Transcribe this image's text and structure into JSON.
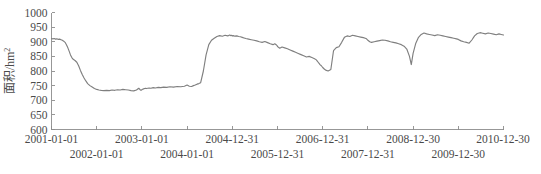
{
  "chart_data": {
    "type": "line",
    "title": "",
    "xlabel": "",
    "ylabel": "面积/hm",
    "ylabel_exponent": "2",
    "ylim": [
      600,
      1000
    ],
    "yticks": [
      600,
      650,
      700,
      750,
      800,
      850,
      900,
      950,
      1000
    ],
    "grid": false,
    "legend": null,
    "line_color": "#7f7f7f",
    "axis_color": "#8c8c8c",
    "xtick_labels_row1": [
      "2001-01-01",
      "2003-01-01",
      "2004-12-31",
      "2006-12-31",
      "2008-12-30",
      "2010-12-30"
    ],
    "xtick_labels_row2": [
      "2002-01-01",
      "2004-01-01",
      "2005-12-31",
      "2007-12-31",
      "2009-12-30"
    ],
    "xticks": [
      {
        "label": "2001-01-01",
        "row": 1,
        "t": 0
      },
      {
        "label": "2002-01-01",
        "row": 2,
        "t": 1
      },
      {
        "label": "2003-01-01",
        "row": 1,
        "t": 2
      },
      {
        "label": "2004-01-01",
        "row": 2,
        "t": 3
      },
      {
        "label": "2004-12-31",
        "row": 1,
        "t": 4
      },
      {
        "label": "2005-12-31",
        "row": 2,
        "t": 5
      },
      {
        "label": "2006-12-31",
        "row": 1,
        "t": 6
      },
      {
        "label": "2007-12-31",
        "row": 2,
        "t": 7
      },
      {
        "label": "2008-12-30",
        "row": 1,
        "t": 8
      },
      {
        "label": "2009-12-30",
        "row": 2,
        "t": 9
      },
      {
        "label": "2010-12-30",
        "row": 1,
        "t": 10
      }
    ],
    "xlim": [
      0,
      10
    ],
    "x": [
      0.0,
      0.03,
      0.06,
      0.09,
      0.12,
      0.15,
      0.18,
      0.21,
      0.24,
      0.27,
      0.3,
      0.33,
      0.36,
      0.39,
      0.42,
      0.45,
      0.48,
      0.52,
      0.56,
      0.6,
      0.64,
      0.68,
      0.72,
      0.76,
      0.8,
      0.85,
      0.9,
      0.95,
      1.0,
      1.05,
      1.1,
      1.16,
      1.22,
      1.28,
      1.34,
      1.4,
      1.46,
      1.52,
      1.58,
      1.64,
      1.7,
      1.76,
      1.82,
      1.88,
      1.93,
      1.96,
      1.98,
      2.0,
      2.02,
      2.04,
      2.06,
      2.08,
      2.1,
      2.13,
      2.16,
      2.2,
      2.25,
      2.3,
      2.36,
      2.42,
      2.48,
      2.55,
      2.62,
      2.7,
      2.78,
      2.86,
      2.94,
      3.0,
      3.05,
      3.1,
      3.14,
      3.18,
      3.22,
      3.26,
      3.3,
      3.36,
      3.42,
      3.48,
      3.54,
      3.6,
      3.66,
      3.72,
      3.78,
      3.84,
      3.9,
      3.94,
      3.97,
      3.99,
      4.0,
      4.02,
      4.06,
      4.1,
      4.14,
      4.18,
      4.22,
      4.26,
      4.3,
      4.36,
      4.42,
      4.48,
      4.54,
      4.6,
      4.66,
      4.72,
      4.78,
      4.84,
      4.9,
      4.94,
      4.97,
      4.99,
      5.0,
      5.02,
      5.05,
      5.1,
      5.16,
      5.22,
      5.28,
      5.34,
      5.4,
      5.46,
      5.52,
      5.58,
      5.64,
      5.7,
      5.76,
      5.82,
      5.86,
      5.88,
      5.9,
      5.92,
      5.94,
      5.97,
      6.0,
      6.04,
      6.08,
      6.12,
      6.18,
      6.24,
      6.3,
      6.36,
      6.42,
      6.48,
      6.54,
      6.6,
      6.66,
      6.72,
      6.78,
      6.84,
      6.9,
      6.94,
      6.97,
      7.0,
      7.04,
      7.08,
      7.14,
      7.2,
      7.26,
      7.32,
      7.38,
      7.44,
      7.5,
      7.56,
      7.62,
      7.68,
      7.74,
      7.8,
      7.86,
      7.92,
      7.96,
      8.0,
      8.06,
      8.12,
      8.18,
      8.24,
      8.3,
      8.36,
      8.42,
      8.48,
      8.54,
      8.6,
      8.66,
      8.72,
      8.78,
      8.84,
      8.9,
      8.96,
      9.0,
      9.06,
      9.12,
      9.18,
      9.24,
      9.3,
      9.36,
      9.42,
      9.48,
      9.54,
      9.6,
      9.66,
      9.72,
      9.78,
      9.84,
      9.9,
      9.95,
      10.0
    ],
    "y": [
      911,
      910,
      911,
      909,
      910,
      908,
      909,
      907,
      905,
      902,
      898,
      890,
      880,
      868,
      855,
      846,
      840,
      836,
      830,
      818,
      802,
      788,
      776,
      766,
      757,
      750,
      745,
      740,
      737,
      735,
      734,
      733,
      734,
      733,
      735,
      734,
      736,
      735,
      737,
      736,
      735,
      733,
      732,
      735,
      741,
      736,
      734,
      736,
      738,
      739,
      740,
      741,
      740,
      741,
      742,
      741,
      743,
      742,
      744,
      743,
      745,
      744,
      746,
      745,
      747,
      746,
      748,
      752,
      748,
      747,
      750,
      752,
      755,
      757,
      760,
      800,
      855,
      890,
      905,
      912,
      918,
      921,
      919,
      922,
      920,
      923,
      921,
      922,
      920,
      921,
      919,
      920,
      918,
      917,
      915,
      913,
      911,
      909,
      907,
      905,
      903,
      900,
      898,
      901,
      897,
      893,
      890,
      893,
      890,
      887,
      884,
      881,
      878,
      882,
      879,
      876,
      872,
      868,
      864,
      860,
      856,
      852,
      848,
      850,
      846,
      842,
      838,
      834,
      830,
      826,
      822,
      818,
      812,
      806,
      802,
      800,
      805,
      870,
      880,
      883,
      898,
      915,
      920,
      918,
      922,
      920,
      918,
      916,
      914,
      912,
      910,
      905,
      900,
      898,
      900,
      902,
      904,
      906,
      905,
      903,
      900,
      898,
      896,
      893,
      890,
      885,
      875,
      850,
      822,
      860,
      895,
      915,
      925,
      930,
      927,
      925,
      923,
      921,
      924,
      922,
      920,
      918,
      916,
      914,
      912,
      910,
      908,
      903,
      900,
      898,
      895,
      906,
      920,
      928,
      931,
      929,
      927,
      930,
      928,
      926,
      924,
      927,
      925,
      923,
      926,
      924,
      922,
      920,
      923,
      921,
      925,
      928,
      930,
      935,
      940,
      945,
      948,
      944,
      940,
      937,
      935,
      933,
      931,
      929,
      927,
      925,
      923,
      921,
      919,
      917,
      915,
      913,
      911,
      909,
      907,
      905,
      903,
      906,
      908,
      912,
      918,
      922,
      925,
      923,
      921,
      919,
      922,
      920,
      918,
      921,
      919,
      922,
      920,
      918,
      921,
      919,
      917,
      920,
      918,
      916,
      919,
      917,
      915,
      918,
      916,
      914,
      912,
      910,
      908,
      906,
      909,
      907,
      905,
      903,
      901,
      899,
      897,
      895,
      893,
      891,
      896,
      894,
      892,
      890,
      893,
      891,
      889,
      890,
      893,
      890,
      887,
      885,
      888,
      886
    ]
  }
}
